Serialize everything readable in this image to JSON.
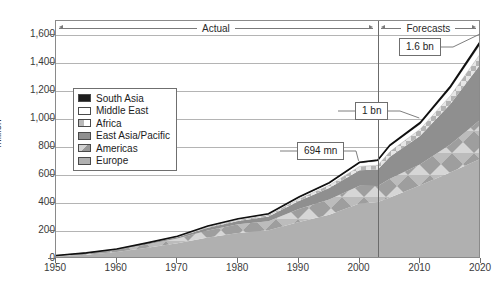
{
  "chart_data": {
    "type": "area",
    "stacked": true,
    "title": "",
    "xlabel": "",
    "ylabel": "million",
    "xlim": [
      1950,
      2020
    ],
    "ylim": [
      0,
      1700
    ],
    "yticks": [
      0,
      200,
      400,
      600,
      800,
      1000,
      1200,
      1400,
      1600
    ],
    "ytick_labels": [
      "0",
      "200",
      "400",
      "600",
      "800",
      "1,000",
      "1,200",
      "1,400",
      "1,600"
    ],
    "xticks": [
      1950,
      1960,
      1970,
      1980,
      1990,
      2000,
      2010,
      2020
    ],
    "xtick_labels": [
      "1950",
      "1960",
      "1970",
      "1980",
      "1990",
      "2000",
      "2010",
      "2020"
    ],
    "grid": true,
    "legend_position": "inside-left",
    "x": [
      1950,
      1955,
      1960,
      1965,
      1970,
      1975,
      1980,
      1985,
      1990,
      1995,
      2000,
      2003,
      2005,
      2010,
      2015,
      2020
    ],
    "series": [
      {
        "name": "Europe",
        "color": "#b0b0b0",
        "values": [
          17,
          30,
          50,
          81,
          113,
          154,
          186,
          205,
          265,
          316,
          396,
          408,
          440,
          527,
          620,
          717
        ]
      },
      {
        "name": "Americas",
        "color": "#c4c4c4",
        "values": [
          7,
          11,
          16,
          23,
          33,
          50,
          62,
          65,
          93,
          109,
          128,
          113,
          134,
          150,
          199,
          282
        ]
      },
      {
        "name": "East Asia/Pacific",
        "color": "#8f8f8f",
        "values": [
          0.2,
          1,
          3,
          6,
          10,
          20,
          23,
          33,
          56,
          82,
          110,
          119,
          156,
          204,
          290,
          397
        ]
      },
      {
        "name": "Africa",
        "color": "#bdbdbd",
        "values": [
          0.5,
          1,
          1,
          2,
          3,
          5,
          7,
          9,
          15,
          20,
          27,
          30,
          37,
          47,
          59,
          77
        ]
      },
      {
        "name": "Middle East",
        "color": "#ffffff",
        "values": [
          0.2,
          0.5,
          1,
          2,
          3,
          5,
          7,
          8,
          10,
          14,
          24,
          30,
          39,
          36,
          54,
          69
        ]
      },
      {
        "name": "South Asia",
        "color": "#1d1d1d",
        "values": [
          0.2,
          0.3,
          0.5,
          1,
          1,
          2,
          2,
          3,
          4,
          4,
          6,
          7,
          8,
          11,
          14,
          19
        ]
      }
    ],
    "annotations": [
      {
        "label": "694 mn",
        "year": 2000,
        "value": 694
      },
      {
        "label": "1 bn",
        "year": 2010,
        "value": 1000
      },
      {
        "label": "1.6 bn",
        "year": 2020,
        "value": 1600
      }
    ],
    "period_spans": [
      {
        "label": "Actual",
        "from": 1950,
        "to": 2003
      },
      {
        "label": "Forecasts",
        "from": 2003,
        "to": 2020
      }
    ],
    "divider_year": 2003
  },
  "legend": {
    "items": [
      {
        "label": "South Asia",
        "swatch": "sw-south-asia"
      },
      {
        "label": "Middle East",
        "swatch": "sw-middle-east"
      },
      {
        "label": "Africa",
        "swatch": "sw-africa"
      },
      {
        "label": "East Asia/Pacific",
        "swatch": "sw-east-asia"
      },
      {
        "label": "Americas",
        "swatch": "sw-americas"
      },
      {
        "label": "Europe",
        "swatch": "sw-europe"
      }
    ]
  }
}
